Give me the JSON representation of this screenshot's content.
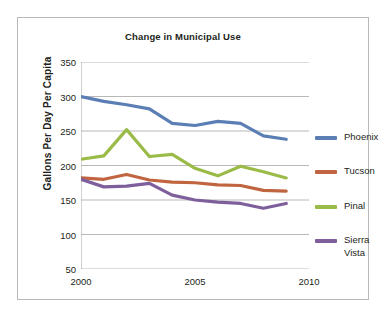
{
  "chart_data": {
    "type": "line",
    "title": "Change in Municipal Use",
    "xlabel": "",
    "ylabel": "Gallons Per Day Per Capita",
    "x": [
      2000,
      2001,
      2002,
      2003,
      2004,
      2005,
      2006,
      2007,
      2008,
      2009
    ],
    "xticks": [
      "2000",
      "2005",
      "2010"
    ],
    "xtick_values": [
      2000,
      2005,
      2010
    ],
    "xlim": [
      2000,
      2010
    ],
    "yticks": [
      "50",
      "100",
      "150",
      "200",
      "250",
      "300",
      "350"
    ],
    "ytick_values": [
      50,
      100,
      150,
      200,
      250,
      300,
      350
    ],
    "ylim": [
      50,
      350
    ],
    "grid": "horizontal",
    "legend_position": "right",
    "series": [
      {
        "name": "Phoenix",
        "color": "#5b7fb4",
        "values": [
          300,
          293,
          288,
          282,
          261,
          258,
          264,
          261,
          243,
          238
        ]
      },
      {
        "name": "Tucson",
        "color": "#c0653f",
        "values": [
          182,
          180,
          187,
          179,
          176,
          175,
          172,
          171,
          164,
          163
        ]
      },
      {
        "name": "Pinal",
        "color": "#9bbb49",
        "values": [
          209,
          214,
          252,
          213,
          216,
          196,
          185,
          199,
          191,
          182
        ]
      },
      {
        "name": "Sierra Vista",
        "color": "#7e5f9b",
        "values": [
          180,
          169,
          170,
          174,
          157,
          150,
          147,
          145,
          138,
          145
        ]
      }
    ]
  },
  "legend": {
    "items": [
      {
        "label": "Phoenix",
        "color": "#5b7fb4"
      },
      {
        "label": "Tucson",
        "color": "#c0653f"
      },
      {
        "label": "Pinal",
        "color": "#9bbb49"
      },
      {
        "label": "Sierra\nVista",
        "color": "#7e5f9b"
      }
    ]
  }
}
